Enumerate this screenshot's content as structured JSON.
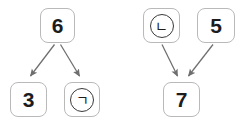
{
  "diagram": {
    "background_color": "#ffffff",
    "node_border_color": "#b9b9b9",
    "arrow_color": "#6e6e6e",
    "text_color": "#1c1c1c",
    "groups": [
      {
        "id": "left-group",
        "name": "divergent-group",
        "source_label": "6",
        "target_labels": [
          "3",
          "ㄱ"
        ]
      },
      {
        "id": "right-group",
        "name": "convergent-group",
        "source_labels": [
          "ㄴ",
          "5"
        ],
        "target_label": "7"
      }
    ],
    "nodes": [
      {
        "id": "node-6",
        "label": "6",
        "kind": "digit",
        "group": "left",
        "role": "source"
      },
      {
        "id": "node-3",
        "label": "3",
        "kind": "digit",
        "group": "left",
        "role": "target"
      },
      {
        "id": "node-g",
        "label": "ㄱ",
        "kind": "circled",
        "group": "left",
        "role": "target"
      },
      {
        "id": "node-n",
        "label": "ㄴ",
        "kind": "circled",
        "group": "right",
        "role": "source"
      },
      {
        "id": "node-5",
        "label": "5",
        "kind": "digit",
        "group": "right",
        "role": "source"
      },
      {
        "id": "node-7",
        "label": "7",
        "kind": "digit",
        "group": "right",
        "role": "target"
      }
    ],
    "arrows": [
      {
        "id": "arrow-6-to-3",
        "from": "6",
        "to": "3",
        "direction": "down-left"
      },
      {
        "id": "arrow-6-to-g",
        "from": "6",
        "to": "ㄱ",
        "direction": "down-right"
      },
      {
        "id": "arrow-n-to-7",
        "from": "ㄴ",
        "to": "7",
        "direction": "down-right"
      },
      {
        "id": "arrow-5-to-7",
        "from": "5",
        "to": "7",
        "direction": "down-left"
      }
    ]
  }
}
